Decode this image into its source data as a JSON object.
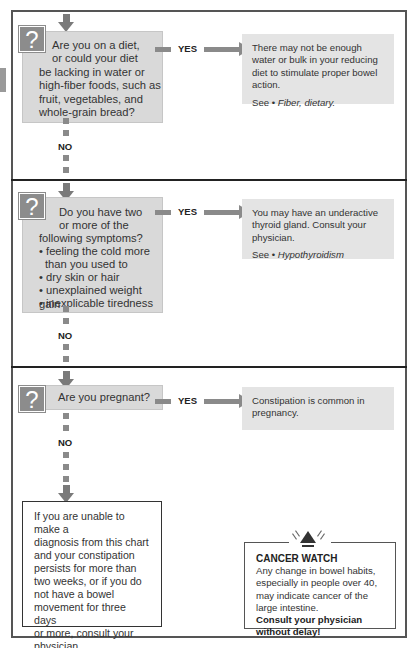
{
  "diagram": {
    "type": "decision-flowchart",
    "topic": "Constipation self-diagnosis",
    "questions": [
      {
        "id": "q1",
        "icon": "question-mark-icon",
        "lines": [
          "Are you on a diet,",
          "or could your diet",
          "be lacking in water or",
          "high-fiber foods, such as",
          "fruit, vegetables, and",
          "whole-grain bread?"
        ],
        "yes_label": "YES",
        "no_label": "NO",
        "answer": {
          "text": "There may not be enough water or bulk in your reducing diet to stimulate proper bowel action.",
          "see_prefix": "See • ",
          "see_ref": "Fiber, dietary."
        }
      },
      {
        "id": "q2",
        "icon": "question-mark-icon",
        "lines": [
          "Do you have two",
          "or more of the",
          "following symptoms?",
          "• feeling the cold more",
          "  than you used to",
          "• dry skin or hair",
          "• unexplained weight gain",
          "• inexplicable tiredness"
        ],
        "yes_label": "YES",
        "no_label": "NO",
        "answer": {
          "text": "You may have an underactive thyroid gland. Consult your physician.",
          "see_prefix": "See • ",
          "see_ref": "Hypothyroidism"
        }
      },
      {
        "id": "q3",
        "icon": "question-mark-icon",
        "lines": [
          "Are you pregnant?"
        ],
        "yes_label": "YES",
        "no_label": "NO",
        "answer": {
          "text": "Constipation is common in pregnancy."
        }
      }
    ],
    "final_box": {
      "lines": [
        "If you are unable to make a",
        "diagnosis from this chart",
        "and your constipation",
        "persists for more than",
        "two weeks, or if you do",
        "not have a bowel",
        "movement for three days",
        "or more, consult your",
        "physician."
      ]
    },
    "cancer_watch": {
      "icon": "warning-triangle-icon",
      "title": "CANCER WATCH",
      "text": "Any change in bowel habits, especially in people over 40, may indicate cancer of the large intestine.",
      "warning_line1": "Consult your physician",
      "warning_line2": "without delay!"
    },
    "colors": {
      "question_box": "#d9d9d9",
      "answer_box": "#e4e4e4",
      "arrow": "#8a8a8a",
      "question_icon": "#8c8c8c",
      "frame": "#555555"
    }
  }
}
